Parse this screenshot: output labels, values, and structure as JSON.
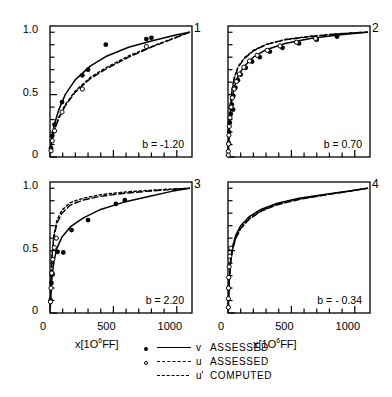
{
  "chart_data": {
    "type": "line",
    "title": "",
    "subtitle": "",
    "xlabel": "x[10⁶FF]",
    "ylabel": "",
    "xlim": [
      0,
      1120
    ],
    "ylim": [
      0,
      1.05
    ],
    "xticks": [
      0,
      500,
      1000
    ],
    "xticklabels": [
      "0",
      "500",
      "1000"
    ],
    "xminortick_step": 100,
    "yticks": [
      0,
      0.5,
      1.0
    ],
    "yticklabels": [
      "0",
      "0.5",
      "1.0"
    ],
    "yminortick_step": 0.1,
    "grid": false,
    "legend_position": "below",
    "legend": [
      {
        "marker": "filled-circle",
        "line": "solid",
        "symbol": "v",
        "label": "ASSESSED"
      },
      {
        "marker": "open-circle",
        "line": "dashed",
        "symbol": "u",
        "label": "ASSESSED"
      },
      {
        "marker": "none",
        "line": "dotted",
        "symbol": "u'",
        "label": "COMPUTED"
      }
    ],
    "panels": [
      {
        "number": "1",
        "annotation": "b = -1.20",
        "series": [
          {
            "name": "v ASSESSED",
            "style": "solid",
            "marker": "filled-circle",
            "x": [
              5,
              12,
              22,
              40,
              70,
              120,
              200,
              320,
              450,
              620,
              800,
              1000,
              1100
            ],
            "y": [
              0.06,
              0.13,
              0.2,
              0.28,
              0.38,
              0.5,
              0.62,
              0.73,
              0.81,
              0.88,
              0.93,
              0.98,
              1.0
            ]
          },
          {
            "name": "u ASSESSED",
            "style": "dashed",
            "marker": "open-circle",
            "x": [
              5,
              12,
              22,
              40,
              70,
              120,
              200,
              320,
              450,
              620,
              800,
              1000,
              1100
            ],
            "y": [
              0.04,
              0.1,
              0.16,
              0.23,
              0.31,
              0.41,
              0.52,
              0.63,
              0.71,
              0.8,
              0.88,
              0.96,
              1.0
            ]
          },
          {
            "name": "u' COMPUTED",
            "style": "dotted",
            "marker": "none",
            "x": [
              5,
              12,
              22,
              40,
              70,
              120,
              200,
              320,
              450,
              620,
              800,
              1000,
              1100
            ],
            "y": [
              0.045,
              0.105,
              0.165,
              0.235,
              0.32,
              0.42,
              0.53,
              0.64,
              0.72,
              0.81,
              0.885,
              0.962,
              1.0
            ]
          }
        ],
        "points_filled": [
          {
            "x": 8,
            "y": 0.07
          },
          {
            "x": 18,
            "y": 0.17
          },
          {
            "x": 36,
            "y": 0.26
          },
          {
            "x": 95,
            "y": 0.44
          },
          {
            "x": 255,
            "y": 0.655
          },
          {
            "x": 300,
            "y": 0.7
          },
          {
            "x": 440,
            "y": 0.9
          },
          {
            "x": 760,
            "y": 0.945
          },
          {
            "x": 800,
            "y": 0.955
          }
        ],
        "points_open": [
          {
            "x": 8,
            "y": 0.05
          },
          {
            "x": 18,
            "y": 0.13
          },
          {
            "x": 36,
            "y": 0.21
          },
          {
            "x": 95,
            "y": 0.36
          },
          {
            "x": 255,
            "y": 0.545
          },
          {
            "x": 760,
            "y": 0.885
          }
        ]
      },
      {
        "number": "2",
        "annotation": "b = 0.70",
        "series": [
          {
            "name": "v ASSESSED",
            "style": "solid",
            "marker": "filled-circle",
            "x": [
              2,
              5,
              10,
              18,
              30,
              50,
              80,
              130,
              200,
              300,
              450,
              650,
              850,
              1050,
              1100
            ],
            "y": [
              0.02,
              0.1,
              0.22,
              0.34,
              0.45,
              0.56,
              0.65,
              0.73,
              0.8,
              0.86,
              0.91,
              0.95,
              0.975,
              0.995,
              1.0
            ]
          },
          {
            "name": "u ASSESSED",
            "style": "dashed",
            "marker": "open-circle",
            "x": [
              2,
              5,
              10,
              18,
              30,
              50,
              80,
              130,
              200,
              300,
              450,
              650,
              850,
              1050,
              1100
            ],
            "y": [
              0.02,
              0.12,
              0.26,
              0.4,
              0.52,
              0.63,
              0.72,
              0.79,
              0.85,
              0.9,
              0.94,
              0.965,
              0.985,
              0.998,
              1.0
            ]
          },
          {
            "name": "u' COMPUTED",
            "style": "dotted",
            "marker": "none",
            "x": [
              2,
              5,
              10,
              18,
              30,
              50,
              80,
              130,
              200,
              300,
              450,
              650,
              850,
              1050,
              1100
            ],
            "y": [
              0.02,
              0.125,
              0.27,
              0.41,
              0.53,
              0.64,
              0.725,
              0.795,
              0.855,
              0.903,
              0.942,
              0.968,
              0.987,
              0.999,
              1.0
            ]
          }
        ],
        "points_filled": [
          {
            "x": 6,
            "y": 0.11
          },
          {
            "x": 9,
            "y": 0.2
          },
          {
            "x": 14,
            "y": 0.275
          },
          {
            "x": 22,
            "y": 0.345
          },
          {
            "x": 30,
            "y": 0.42
          },
          {
            "x": 42,
            "y": 0.49
          },
          {
            "x": 58,
            "y": 0.555
          },
          {
            "x": 78,
            "y": 0.615
          },
          {
            "x": 100,
            "y": 0.66
          },
          {
            "x": 140,
            "y": 0.715
          },
          {
            "x": 190,
            "y": 0.765
          },
          {
            "x": 250,
            "y": 0.8
          },
          {
            "x": 330,
            "y": 0.845
          },
          {
            "x": 430,
            "y": 0.875
          },
          {
            "x": 560,
            "y": 0.91
          },
          {
            "x": 700,
            "y": 0.94
          },
          {
            "x": 860,
            "y": 0.965
          },
          {
            "x": 40,
            "y": 0.38
          }
        ],
        "points_open": [
          {
            "x": 3,
            "y": 0.045
          },
          {
            "x": 5,
            "y": 0.105
          },
          {
            "x": 7,
            "y": 0.175
          },
          {
            "x": 10,
            "y": 0.245
          },
          {
            "x": 16,
            "y": 0.315
          },
          {
            "x": 24,
            "y": 0.4
          },
          {
            "x": 34,
            "y": 0.475
          },
          {
            "x": 48,
            "y": 0.545
          },
          {
            "x": 66,
            "y": 0.605
          },
          {
            "x": 90,
            "y": 0.665
          },
          {
            "x": 125,
            "y": 0.72
          },
          {
            "x": 170,
            "y": 0.77
          },
          {
            "x": 230,
            "y": 0.815
          },
          {
            "x": 310,
            "y": 0.855
          },
          {
            "x": 410,
            "y": 0.89
          },
          {
            "x": 540,
            "y": 0.92
          },
          {
            "x": 690,
            "y": 0.95
          },
          {
            "x": 2,
            "y": 0.015
          }
        ]
      },
      {
        "number": "3",
        "annotation": "b = 2.20",
        "series": [
          {
            "name": "v ASSESSED",
            "style": "solid",
            "marker": "filled-circle",
            "x": [
              3,
              8,
              16,
              30,
              55,
              95,
              160,
              260,
              400,
              570,
              760,
              960,
              1100
            ],
            "y": [
              0.05,
              0.17,
              0.29,
              0.41,
              0.52,
              0.61,
              0.69,
              0.76,
              0.83,
              0.885,
              0.93,
              0.975,
              1.0
            ]
          },
          {
            "name": "u ASSESSED",
            "style": "dashed",
            "marker": "open-circle",
            "x": [
              3,
              8,
              16,
              30,
              55,
              95,
              160,
              260,
              400,
              570,
              760,
              960,
              1100
            ],
            "y": [
              0.08,
              0.27,
              0.45,
              0.6,
              0.72,
              0.8,
              0.865,
              0.905,
              0.935,
              0.958,
              0.975,
              0.99,
              1.0
            ]
          },
          {
            "name": "u' COMPUTED",
            "style": "dotted",
            "marker": "none",
            "x": [
              3,
              8,
              16,
              30,
              55,
              95,
              160,
              260,
              400,
              570,
              760,
              960,
              1100
            ],
            "y": [
              0.085,
              0.285,
              0.47,
              0.625,
              0.745,
              0.825,
              0.885,
              0.92,
              0.948,
              0.968,
              0.982,
              0.994,
              1.0
            ]
          }
        ],
        "points_filled": [
          {
            "x": 5,
            "y": 0.1
          },
          {
            "x": 12,
            "y": 0.24
          },
          {
            "x": 20,
            "y": 0.31
          },
          {
            "x": 60,
            "y": 0.49
          },
          {
            "x": 105,
            "y": 0.485
          },
          {
            "x": 170,
            "y": 0.665
          },
          {
            "x": 300,
            "y": 0.745
          },
          {
            "x": 520,
            "y": 0.875
          },
          {
            "x": 590,
            "y": 0.905
          }
        ],
        "points_open": [
          {
            "x": 4,
            "y": 0.09
          },
          {
            "x": 8,
            "y": 0.2
          },
          {
            "x": 14,
            "y": 0.32
          },
          {
            "x": 22,
            "y": 0.43
          },
          {
            "x": 34,
            "y": 0.525
          },
          {
            "x": 50,
            "y": 0.6
          }
        ]
      },
      {
        "number": "4",
        "annotation": "b = - 0.34",
        "series": [
          {
            "name": "v ASSESSED",
            "style": "solid",
            "marker": "filled-circle",
            "x": [
              2,
              5,
              11,
              20,
              35,
              60,
              100,
              165,
              260,
              390,
              560,
              760,
              970,
              1100
            ],
            "y": [
              0.03,
              0.14,
              0.29,
              0.42,
              0.53,
              0.62,
              0.7,
              0.77,
              0.83,
              0.88,
              0.92,
              0.95,
              0.98,
              1.0
            ]
          },
          {
            "name": "u ASSESSED",
            "style": "dashed",
            "marker": "open-circle",
            "x": [
              2,
              5,
              11,
              20,
              35,
              60,
              100,
              165,
              260,
              390,
              560,
              760,
              970,
              1100
            ],
            "y": [
              0.03,
              0.13,
              0.27,
              0.395,
              0.505,
              0.595,
              0.675,
              0.75,
              0.815,
              0.868,
              0.91,
              0.945,
              0.978,
              1.0
            ]
          },
          {
            "name": "u' COMPUTED",
            "style": "dotted",
            "marker": "none",
            "x": [
              2,
              5,
              11,
              20,
              35,
              60,
              100,
              165,
              260,
              390,
              560,
              760,
              970,
              1100
            ],
            "y": [
              0.03,
              0.132,
              0.273,
              0.4,
              0.51,
              0.6,
              0.68,
              0.755,
              0.82,
              0.872,
              0.913,
              0.947,
              0.979,
              1.0
            ]
          }
        ],
        "points_filled": [],
        "points_open": [
          {
            "x": 3,
            "y": 0.045
          },
          {
            "x": 3,
            "y": 0.115
          },
          {
            "x": 4,
            "y": 0.2
          },
          {
            "x": 6,
            "y": 0.285
          },
          {
            "x": 9,
            "y": 0.37
          },
          {
            "x": 14,
            "y": 0.455
          },
          {
            "x": 22,
            "y": 0.52
          }
        ]
      }
    ]
  }
}
